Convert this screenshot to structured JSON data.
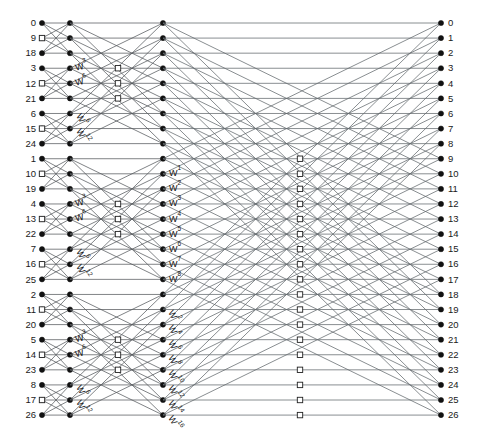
{
  "figure": {
    "type": "signal-flow-diagram",
    "width": 483,
    "height": 443,
    "background_color": "#ffffff",
    "line_color": "#555a5e",
    "node_color": "#111111",
    "hollow_node_color": "#ffffff"
  },
  "chart_data": {
    "type": "diagram",
    "stages": 3,
    "radix": 3,
    "rows": 27,
    "columns": [
      {
        "name": "input",
        "x": 42,
        "node_style": "solid"
      },
      {
        "name": "stage1-out",
        "x": 70,
        "node_style": "solid"
      },
      {
        "name": "stage1-twiddle",
        "x": 118,
        "node_style": "hollow"
      },
      {
        "name": "stage2-in",
        "x": 163,
        "node_style": "solid"
      },
      {
        "name": "stage2-twiddle",
        "x": 300,
        "node_style": "hollow"
      },
      {
        "name": "output",
        "x": 441,
        "node_style": "solid"
      }
    ],
    "row_geometry": {
      "first_y": 23,
      "spacing": 15.08,
      "count": 27
    },
    "input_labels": [
      "0",
      "9",
      "18",
      "3",
      "12",
      "21",
      "6",
      "15",
      "24",
      "1",
      "10",
      "19",
      "4",
      "13",
      "22",
      "7",
      "16",
      "25",
      "2",
      "11",
      "20",
      "5",
      "14",
      "23",
      "8",
      "17",
      "26"
    ],
    "output_labels": [
      "0",
      "1",
      "2",
      "3",
      "4",
      "5",
      "6",
      "7",
      "8",
      "9",
      "10",
      "11",
      "12",
      "13",
      "14",
      "15",
      "16",
      "17",
      "18",
      "19",
      "20",
      "21",
      "22",
      "23",
      "24",
      "25",
      "26"
    ],
    "stage1_twiddles": [
      {
        "group": 0,
        "rows": [
          3,
          4,
          5
        ],
        "labels": [
          "W3",
          "W6"
        ],
        "orientation": "horizontal",
        "base": "W",
        "exponents": [
          3,
          6
        ]
      },
      {
        "group": 0,
        "rows": [
          6,
          7,
          8
        ],
        "labels": [
          "W6",
          "W12"
        ],
        "orientation": "rotated",
        "base": "W",
        "exponents": [
          6,
          12
        ]
      },
      {
        "group": 1,
        "rows": [
          12,
          13,
          14
        ],
        "labels": [
          "W3",
          "W6"
        ],
        "orientation": "horizontal",
        "base": "W",
        "exponents": [
          3,
          6
        ]
      },
      {
        "group": 1,
        "rows": [
          15,
          16,
          17
        ],
        "labels": [
          "W6",
          "W12"
        ],
        "orientation": "rotated",
        "base": "W",
        "exponents": [
          6,
          12
        ]
      },
      {
        "group": 2,
        "rows": [
          21,
          22,
          23
        ],
        "labels": [
          "W3",
          "W6"
        ],
        "orientation": "horizontal",
        "base": "W",
        "exponents": [
          3,
          6
        ]
      },
      {
        "group": 2,
        "rows": [
          24,
          25,
          26
        ],
        "labels": [
          "W6",
          "W12"
        ],
        "orientation": "rotated",
        "base": "W",
        "exponents": [
          6,
          12
        ]
      }
    ],
    "stage2_twiddles_middle": {
      "orientation": "horizontal",
      "base": "W",
      "rows": [
        10,
        11,
        12,
        13,
        14,
        15,
        16,
        17
      ],
      "exponents": [
        1,
        2,
        3,
        4,
        5,
        6,
        7,
        8
      ],
      "labels": [
        "W1",
        "W2",
        "W3",
        "W4",
        "W5",
        "W6",
        "W7",
        "W8"
      ]
    },
    "stage2_twiddles_bottom": {
      "orientation": "rotated",
      "base": "W",
      "rows": [
        19,
        20,
        21,
        22,
        23,
        24,
        25,
        26
      ],
      "exponents": [
        2,
        4,
        6,
        8,
        10,
        12,
        14,
        16
      ],
      "labels": [
        "W2",
        "W4",
        "W6",
        "W8",
        "W10",
        "W12",
        "W14",
        "W16"
      ]
    }
  }
}
